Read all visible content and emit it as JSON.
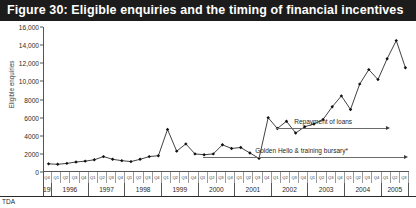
{
  "figure": {
    "title": "Figure 30: Eligible enquiries and the timing of financial incentives",
    "source_note": "TDA"
  },
  "annotations": {
    "repayment": "Repayment of loans",
    "golden_hello": "Golden Hello & training bursary*"
  },
  "colors": {
    "title_bar": "#1c1c1c",
    "title_text": "#ffffff",
    "series": "#111111",
    "axis": "#555555",
    "annotation": "#6b6b6b"
  },
  "chart_data": {
    "type": "line",
    "title": "Figure 30: Eligible enquiries and the timing of financial incentives",
    "xlabel": "",
    "ylabel": "Eligible enquiries",
    "ylim": [
      0,
      16000
    ],
    "ytick_labels": [
      "16,000",
      "14,000",
      "12,000",
      "10,000",
      "8000",
      "6000",
      "4000",
      "2000",
      "0"
    ],
    "ytick_values": [
      16000,
      14000,
      12000,
      10000,
      8000,
      6000,
      4000,
      2000,
      0
    ],
    "grid": false,
    "legend": "none",
    "years": [
      "1995",
      "1996",
      "1997",
      "1998",
      "1999",
      "2000",
      "2001",
      "2002",
      "2003",
      "2004",
      "2005"
    ],
    "year_quarter_counts": [
      1,
      4,
      4,
      4,
      4,
      4,
      4,
      4,
      4,
      4,
      3
    ],
    "quarters": [
      "Q4",
      "Q1",
      "Q2",
      "Q3",
      "Q4",
      "Q1",
      "Q2",
      "Q3",
      "Q4",
      "Q1",
      "Q2",
      "Q3",
      "Q4",
      "Q1",
      "Q2",
      "Q3",
      "Q4",
      "Q1",
      "Q2",
      "Q3",
      "Q4",
      "Q1",
      "Q2",
      "Q3",
      "Q4",
      "Q1",
      "Q2",
      "Q3",
      "Q4",
      "Q1",
      "Q2",
      "Q3",
      "Q4",
      "Q1",
      "Q2",
      "Q3",
      "Q4",
      "Q1",
      "Q2",
      "Q3",
      "Q4",
      "Q1",
      "Q2",
      "Q3"
    ],
    "x": [
      "1995 Q4",
      "1996 Q1",
      "1996 Q2",
      "1996 Q3",
      "1996 Q4",
      "1997 Q1",
      "1997 Q2",
      "1997 Q3",
      "1997 Q4",
      "1998 Q1",
      "1998 Q2",
      "1998 Q3",
      "1998 Q4",
      "1999 Q1",
      "1999 Q2",
      "1999 Q3",
      "1999 Q4",
      "2000 Q1",
      "2000 Q2",
      "2000 Q3",
      "2000 Q4",
      "2001 Q1",
      "2001 Q2",
      "2001 Q3",
      "2001 Q4",
      "2002 Q1",
      "2002 Q2",
      "2002 Q3",
      "2002 Q4",
      "2003 Q1",
      "2003 Q2",
      "2003 Q3",
      "2003 Q4",
      "2004 Q1",
      "2004 Q2",
      "2004 Q3",
      "2004 Q4",
      "2005 Q1",
      "2005 Q2",
      "2005 Q3"
    ],
    "values": [
      900,
      850,
      950,
      1100,
      1200,
      1350,
      1700,
      1400,
      1250,
      1150,
      1400,
      1700,
      1800,
      4700,
      2300,
      3100,
      2000,
      1900,
      2000,
      3000,
      2600,
      2700,
      2100,
      1500,
      6000,
      4800,
      5600,
      4300,
      5000,
      5300,
      5800,
      7200,
      8400,
      6900,
      9700,
      11300,
      10200,
      12500,
      14500,
      11500
    ],
    "series": [
      {
        "name": "Eligible enquiries",
        "marker": "diamond",
        "values": [
          900,
          850,
          950,
          1100,
          1200,
          1350,
          1700,
          1400,
          1250,
          1150,
          1400,
          1700,
          1800,
          4700,
          2300,
          3100,
          2000,
          1900,
          2000,
          3000,
          2600,
          2700,
          2100,
          1500,
          6000,
          4800,
          5600,
          4300,
          5000,
          5300,
          5800,
          7200,
          8400,
          6900,
          9700,
          11300,
          10200,
          12500,
          14500,
          11500
        ]
      }
    ],
    "annotations": [
      {
        "label": "Repayment of loans",
        "start_x": "2002 Q1",
        "end_x": "2005 Q1",
        "style": "arrow-right"
      },
      {
        "label": "Golden Hello & training bursary*",
        "start_x": "2000 Q1",
        "end_x": "2005 Q3",
        "style": "arrow-right"
      }
    ]
  }
}
